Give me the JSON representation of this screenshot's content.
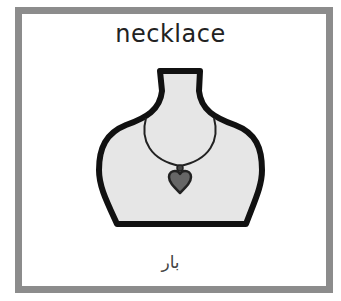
{
  "card": {
    "title": "necklace",
    "translation": "بار",
    "illustration": "necklace-on-bust-icon"
  },
  "colors": {
    "border": "#8c8c8c",
    "bust_fill": "#e6e6e6",
    "outline": "#111111",
    "pendant": "#666666",
    "background": "#ffffff"
  }
}
